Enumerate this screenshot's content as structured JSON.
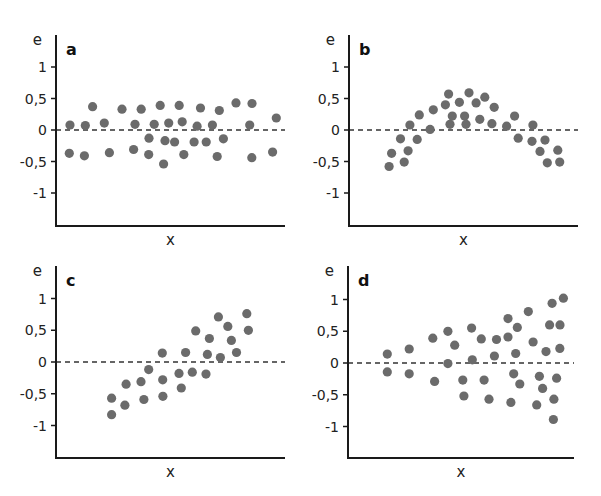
{
  "chart_data": [
    {
      "type": "scatter",
      "panel": "a",
      "title": "a",
      "xlabel": "x",
      "ylabel": "e",
      "xlim": [
        0,
        10
      ],
      "ylim": [
        -1.5,
        1.4
      ],
      "yticks": [
        1,
        0.5,
        0,
        -0.5,
        -1
      ],
      "ytick_labels": [
        "1",
        "0,5",
        "0",
        "-0,5",
        "-1"
      ],
      "reference_line": {
        "y": 0,
        "style": "dashed"
      },
      "points": [
        {
          "x": 0.61,
          "y": 0.08
        },
        {
          "x": 0.58,
          "y": -0.37
        },
        {
          "x": 1.28,
          "y": 0.07
        },
        {
          "x": 1.24,
          "y": -0.41
        },
        {
          "x": 1.6,
          "y": 0.37
        },
        {
          "x": 2.11,
          "y": 0.11
        },
        {
          "x": 2.33,
          "y": -0.36
        },
        {
          "x": 2.88,
          "y": 0.33
        },
        {
          "x": 3.45,
          "y": 0.09
        },
        {
          "x": 3.39,
          "y": -0.31
        },
        {
          "x": 3.72,
          "y": 0.33
        },
        {
          "x": 4.06,
          "y": -0.13
        },
        {
          "x": 4.29,
          "y": 0.09
        },
        {
          "x": 4.05,
          "y": -0.39
        },
        {
          "x": 4.55,
          "y": 0.39
        },
        {
          "x": 4.92,
          "y": 0.11
        },
        {
          "x": 4.76,
          "y": -0.17
        },
        {
          "x": 4.7,
          "y": -0.54
        },
        {
          "x": 5.38,
          "y": 0.39
        },
        {
          "x": 5.51,
          "y": 0.13
        },
        {
          "x": 5.18,
          "y": -0.19
        },
        {
          "x": 5.58,
          "y": -0.39
        },
        {
          "x": 6.31,
          "y": 0.35
        },
        {
          "x": 6.16,
          "y": 0.06
        },
        {
          "x": 6.03,
          "y": -0.19
        },
        {
          "x": 6.56,
          "y": -0.19
        },
        {
          "x": 6.83,
          "y": 0.08
        },
        {
          "x": 7.13,
          "y": 0.31
        },
        {
          "x": 7.31,
          "y": -0.14
        },
        {
          "x": 7.04,
          "y": -0.42
        },
        {
          "x": 7.86,
          "y": 0.43
        },
        {
          "x": 8.56,
          "y": 0.42
        },
        {
          "x": 8.46,
          "y": 0.08
        },
        {
          "x": 8.55,
          "y": -0.44
        },
        {
          "x": 9.62,
          "y": 0.19
        },
        {
          "x": 9.46,
          "y": -0.35
        }
      ]
    },
    {
      "type": "scatter",
      "panel": "b",
      "title": "b",
      "xlabel": "x",
      "ylabel": "e",
      "xlim": [
        0,
        10
      ],
      "ylim": [
        -1.5,
        1.4
      ],
      "yticks": [
        1,
        0.5,
        0,
        -0.5,
        -1
      ],
      "ytick_labels": [
        "1",
        "0,5",
        "0",
        "-0,5",
        "-1"
      ],
      "reference_line": {
        "y": 0,
        "style": "dashed"
      },
      "points": [
        {
          "x": 1.75,
          "y": -0.58
        },
        {
          "x": 1.86,
          "y": -0.37
        },
        {
          "x": 2.41,
          "y": -0.51
        },
        {
          "x": 2.58,
          "y": -0.33
        },
        {
          "x": 2.25,
          "y": -0.14
        },
        {
          "x": 2.98,
          "y": -0.15
        },
        {
          "x": 2.66,
          "y": 0.08
        },
        {
          "x": 3.07,
          "y": 0.24
        },
        {
          "x": 3.54,
          "y": 0.01
        },
        {
          "x": 3.68,
          "y": 0.32
        },
        {
          "x": 4.21,
          "y": 0.4
        },
        {
          "x": 4.35,
          "y": 0.57
        },
        {
          "x": 4.51,
          "y": 0.22
        },
        {
          "x": 4.41,
          "y": 0.09
        },
        {
          "x": 4.82,
          "y": 0.44
        },
        {
          "x": 5.05,
          "y": 0.22
        },
        {
          "x": 5.11,
          "y": 0.09
        },
        {
          "x": 5.24,
          "y": 0.59
        },
        {
          "x": 5.55,
          "y": 0.43
        },
        {
          "x": 5.93,
          "y": 0.52
        },
        {
          "x": 5.71,
          "y": 0.17
        },
        {
          "x": 6.34,
          "y": 0.36
        },
        {
          "x": 6.24,
          "y": 0.1
        },
        {
          "x": 6.88,
          "y": 0.06
        },
        {
          "x": 7.23,
          "y": 0.22
        },
        {
          "x": 7.39,
          "y": -0.13
        },
        {
          "x": 8.03,
          "y": 0.08
        },
        {
          "x": 7.99,
          "y": -0.18
        },
        {
          "x": 8.56,
          "y": -0.16
        },
        {
          "x": 8.34,
          "y": -0.34
        },
        {
          "x": 9.12,
          "y": -0.32
        },
        {
          "x": 8.66,
          "y": -0.52
        },
        {
          "x": 9.2,
          "y": -0.51
        }
      ]
    },
    {
      "type": "scatter",
      "panel": "c",
      "title": "c",
      "xlabel": "x",
      "ylabel": "e",
      "xlim": [
        0,
        10
      ],
      "ylim": [
        -1.5,
        1.4
      ],
      "yticks": [
        1,
        0.5,
        0,
        -0.5,
        -1
      ],
      "ytick_labels": [
        "1",
        "0,5",
        "0",
        "-0,5",
        "-1"
      ],
      "reference_line": {
        "y": 0,
        "style": "dashed"
      },
      "points": [
        {
          "x": 2.43,
          "y": -0.57
        },
        {
          "x": 2.43,
          "y": -0.83
        },
        {
          "x": 3.06,
          "y": -0.35
        },
        {
          "x": 3.01,
          "y": -0.68
        },
        {
          "x": 3.71,
          "y": -0.31
        },
        {
          "x": 3.84,
          "y": -0.59
        },
        {
          "x": 4.05,
          "y": -0.12
        },
        {
          "x": 4.66,
          "y": -0.28
        },
        {
          "x": 4.67,
          "y": -0.54
        },
        {
          "x": 4.64,
          "y": 0.14
        },
        {
          "x": 5.37,
          "y": -0.18
        },
        {
          "x": 5.47,
          "y": -0.41
        },
        {
          "x": 5.66,
          "y": 0.15
        },
        {
          "x": 5.95,
          "y": -0.16
        },
        {
          "x": 6.1,
          "y": 0.49
        },
        {
          "x": 6.55,
          "y": -0.19
        },
        {
          "x": 6.61,
          "y": 0.12
        },
        {
          "x": 6.7,
          "y": 0.37
        },
        {
          "x": 7.09,
          "y": 0.71
        },
        {
          "x": 7.18,
          "y": 0.07
        },
        {
          "x": 7.5,
          "y": 0.56
        },
        {
          "x": 7.66,
          "y": 0.34
        },
        {
          "x": 7.88,
          "y": 0.15
        },
        {
          "x": 8.33,
          "y": 0.76
        },
        {
          "x": 8.4,
          "y": 0.5
        }
      ]
    },
    {
      "type": "scatter",
      "panel": "d",
      "title": "d",
      "xlabel": "x",
      "ylabel": "e",
      "xlim": [
        0,
        10
      ],
      "ylim": [
        -1.5,
        1.4
      ],
      "yticks": [
        1,
        0.5,
        0,
        -0.5,
        -1
      ],
      "ytick_labels": [
        "1",
        "0,5",
        "0",
        "-0,5",
        "-1"
      ],
      "reference_line": {
        "y": 0,
        "style": "dashed"
      },
      "points": [
        {
          "x": 1.74,
          "y": 0.14
        },
        {
          "x": 1.74,
          "y": -0.14
        },
        {
          "x": 2.71,
          "y": 0.22
        },
        {
          "x": 2.71,
          "y": -0.17
        },
        {
          "x": 3.75,
          "y": 0.39
        },
        {
          "x": 3.83,
          "y": -0.29
        },
        {
          "x": 4.42,
          "y": 0.5
        },
        {
          "x": 4.72,
          "y": 0.28
        },
        {
          "x": 4.42,
          "y": -0.01
        },
        {
          "x": 5.08,
          "y": -0.27
        },
        {
          "x": 5.13,
          "y": -0.52
        },
        {
          "x": 5.47,
          "y": 0.55
        },
        {
          "x": 5.9,
          "y": 0.38
        },
        {
          "x": 5.5,
          "y": 0.05
        },
        {
          "x": 6.02,
          "y": -0.27
        },
        {
          "x": 6.24,
          "y": -0.57
        },
        {
          "x": 6.57,
          "y": 0.37
        },
        {
          "x": 6.48,
          "y": 0.11
        },
        {
          "x": 7.08,
          "y": 0.7
        },
        {
          "x": 7.08,
          "y": 0.41
        },
        {
          "x": 7.49,
          "y": 0.56
        },
        {
          "x": 7.42,
          "y": 0.15
        },
        {
          "x": 7.33,
          "y": -0.17
        },
        {
          "x": 7.6,
          "y": -0.33
        },
        {
          "x": 7.21,
          "y": -0.62
        },
        {
          "x": 7.98,
          "y": 0.81
        },
        {
          "x": 8.19,
          "y": 0.33
        },
        {
          "x": 8.47,
          "y": -0.21
        },
        {
          "x": 8.61,
          "y": -0.4
        },
        {
          "x": 8.35,
          "y": -0.66
        },
        {
          "x": 9.03,
          "y": 0.94
        },
        {
          "x": 8.92,
          "y": 0.6
        },
        {
          "x": 8.76,
          "y": 0.18
        },
        {
          "x": 9.23,
          "y": -0.24
        },
        {
          "x": 9.11,
          "y": -0.57
        },
        {
          "x": 9.09,
          "y": -0.89
        },
        {
          "x": 9.53,
          "y": 1.02
        },
        {
          "x": 9.38,
          "y": 0.6
        },
        {
          "x": 9.37,
          "y": 0.23
        }
      ]
    }
  ]
}
